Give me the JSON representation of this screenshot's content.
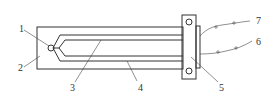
{
  "diagram": {
    "type": "mechanical-schematic",
    "labels": [
      {
        "id": "1",
        "text": "1",
        "x": 19,
        "y": 32
      },
      {
        "id": "2",
        "text": "2",
        "x": 18,
        "y": 71
      },
      {
        "id": "3",
        "text": "3",
        "x": 70,
        "y": 91
      },
      {
        "id": "4",
        "text": "4",
        "x": 138,
        "y": 91
      },
      {
        "id": "5",
        "text": "5",
        "x": 219,
        "y": 91
      },
      {
        "id": "6",
        "text": "6",
        "x": 256,
        "y": 45
      },
      {
        "id": "7",
        "text": "7",
        "x": 256,
        "y": 24
      }
    ],
    "colors": {
      "line": "#333333",
      "background": "#ffffff"
    }
  }
}
